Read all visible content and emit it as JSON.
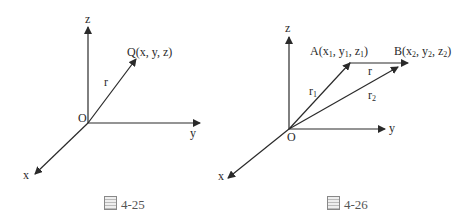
{
  "figures": [
    {
      "caption": "4-25",
      "labels": {
        "z": "z",
        "y": "y",
        "x": "x",
        "origin": "O",
        "point": "Q(x, y, z)",
        "vector": "r"
      }
    },
    {
      "caption": "4-26",
      "labels": {
        "z": "z",
        "y": "y",
        "x": "x",
        "origin": "O",
        "pointA_pre": "A(x",
        "pointA_s1": "1",
        "pointA_m1": ", y",
        "pointA_s2": "1",
        "pointA_m2": ", z",
        "pointA_s3": "1",
        "pointA_post": ")",
        "pointB_pre": "B(x",
        "pointB_s1": "2",
        "pointB_m1": ", y",
        "pointB_s2": "2",
        "pointB_m2": ", z",
        "pointB_s3": "2",
        "pointB_post": ")",
        "vector_r": "r",
        "vector_r1": "r",
        "vector_r1_sub": "1",
        "vector_r2": "r",
        "vector_r2_sub": "2"
      }
    }
  ],
  "caption_prefix": "圖"
}
